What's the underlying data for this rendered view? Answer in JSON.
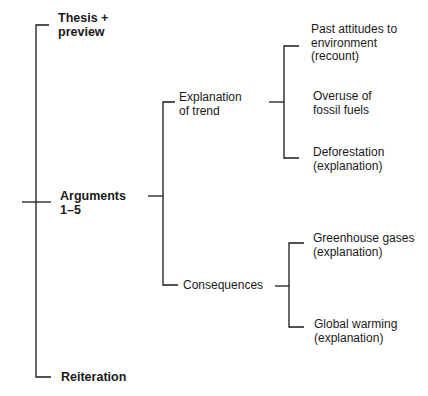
{
  "diagram": {
    "root": {
      "items": [
        {
          "label_line1": "Thesis +",
          "label_line2": "preview"
        },
        {
          "label_line1": "Arguments",
          "label_line2": "1–5"
        },
        {
          "label_line1": "Reiteration"
        }
      ]
    },
    "arguments_children": [
      {
        "label_line1": "Explanation",
        "label_line2": "of trend"
      },
      {
        "label_line1": "Consequences"
      }
    ],
    "explanation_children": [
      {
        "label_line1": "Past attitudes to",
        "label_line2": "environment",
        "label_line3": "(recount)"
      },
      {
        "label_line1": "Overuse of",
        "label_line2": "fossil fuels"
      },
      {
        "label_line1": "Deforestation",
        "label_line2": "(explanation)"
      }
    ],
    "consequences_children": [
      {
        "label_line1": "Greenhouse gases",
        "label_line2": "(explanation)"
      },
      {
        "label_line1": "Global warming",
        "label_line2": "(explanation)"
      }
    ],
    "line_color": "#1a1a1a"
  }
}
